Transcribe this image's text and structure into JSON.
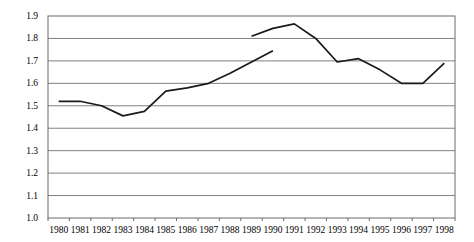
{
  "chart_data": {
    "type": "line",
    "title": "",
    "subtitle": "",
    "xlabel": "",
    "ylabel": "",
    "xlim": [
      1980,
      1998
    ],
    "ylim": [
      1.0,
      1.9
    ],
    "grid": true,
    "grid_axis": "y",
    "legend": false,
    "legend_position": "none",
    "line_color": "#1a1a1a",
    "grid_color": "#808080",
    "frame_color": "#6b6b6b",
    "background_color": "#ffffff",
    "categories": [
      1980,
      1981,
      1982,
      1983,
      1984,
      1985,
      1986,
      1987,
      1988,
      1989,
      1990,
      1991,
      1992,
      1993,
      1994,
      1995,
      1996,
      1997,
      1998
    ],
    "y_ticks": [
      1.0,
      1.1,
      1.2,
      1.3,
      1.4,
      1.5,
      1.6,
      1.7,
      1.8,
      1.9
    ],
    "y_tick_labels": [
      "1.0",
      "1.1",
      "1.2",
      "1.3",
      "1.4",
      "1.5",
      "1.6",
      "1.7",
      "1.8",
      "1.9"
    ],
    "x_tick_labels": [
      "1980",
      "1981",
      "1982",
      "1983",
      "1984",
      "1985",
      "1986",
      "1987",
      "1988",
      "1989",
      "1990",
      "1991",
      "1992",
      "1993",
      "1994",
      "1995",
      "1996",
      "1997",
      "1998"
    ],
    "series": [
      {
        "name": "series-1",
        "x": [
          1980,
          1981,
          1982,
          1983,
          1984,
          1985,
          1986,
          1987,
          1988,
          1989,
          1990
        ],
        "values": [
          1.52,
          1.52,
          1.5,
          1.455,
          1.475,
          1.565,
          1.58,
          1.6,
          1.645,
          1.695,
          1.745
        ]
      },
      {
        "name": "series-2",
        "x": [
          1989,
          1990,
          1991,
          1992,
          1993,
          1994,
          1995,
          1996,
          1997,
          1998
        ],
        "values": [
          1.81,
          1.845,
          1.865,
          1.8,
          1.695,
          1.71,
          1.66,
          1.6,
          1.6,
          1.69
        ]
      }
    ]
  }
}
